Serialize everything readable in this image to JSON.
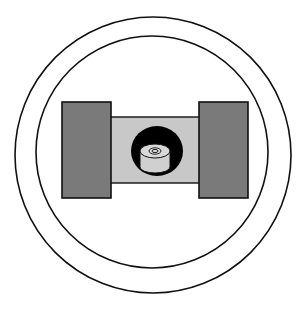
{
  "diagram": {
    "colors": {
      "background": "#ffffff",
      "outline": "#111111",
      "side_block_fill": "#7a7a7a",
      "bridge_fill": "#c8c8c8",
      "recess_fill": "#000000",
      "cylinder_fill": "#d0d0d0",
      "cylinder_top_fill": "#d8d8d8"
    },
    "components": [
      {
        "id": "outer-ring",
        "type": "circle"
      },
      {
        "id": "inner-ring",
        "type": "circle"
      },
      {
        "id": "left-block",
        "type": "rect"
      },
      {
        "id": "right-block",
        "type": "rect"
      },
      {
        "id": "bridge",
        "type": "rect"
      },
      {
        "id": "recess",
        "type": "ellipse"
      },
      {
        "id": "cylinder",
        "type": "cylinder",
        "rings": 2
      }
    ]
  }
}
